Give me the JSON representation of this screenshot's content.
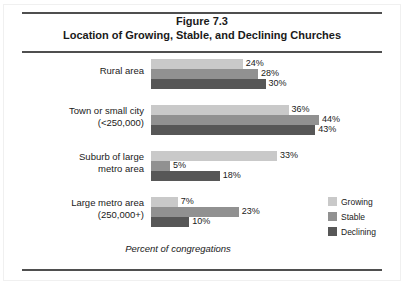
{
  "figure": {
    "number_line": "Figure 7.3",
    "title_line": "Location of Growing, Stable, and Declining Churches"
  },
  "chart_data": {
    "type": "bar",
    "orientation": "horizontal",
    "title": "Figure 7.3 Location of Growing, Stable, and Declining Churches",
    "xlabel": "Percent of congregations",
    "ylabel": "",
    "xlim": [
      0,
      50
    ],
    "grid": false,
    "legend_position": "right-bottom",
    "value_suffix": "%",
    "categories": [
      "Rural area",
      "Town or small city (<250,000)",
      "Suburb of large metro area",
      "Large metro area (250,000+)"
    ],
    "category_lines": [
      [
        "Rural area"
      ],
      [
        "Town or small city",
        "(<250,000)"
      ],
      [
        "Suburb of large",
        "metro area"
      ],
      [
        "Large metro area",
        "(250,000+)"
      ]
    ],
    "series": [
      {
        "name": "Growing",
        "color": "#c9c9c9",
        "values": [
          24,
          36,
          33,
          7
        ],
        "labels": [
          "24%",
          "36%",
          "33%",
          "7%"
        ]
      },
      {
        "name": "Stable",
        "color": "#919191",
        "values": [
          28,
          44,
          5,
          23
        ],
        "labels": [
          "28%",
          "44%",
          "5%",
          "23%"
        ]
      },
      {
        "name": "Declining",
        "color": "#575757",
        "values": [
          30,
          43,
          18,
          10
        ],
        "labels": [
          "30%",
          "43%",
          "18%",
          "10%"
        ]
      }
    ]
  },
  "legend": {
    "items": [
      {
        "label": "Growing",
        "color": "#c9c9c9"
      },
      {
        "label": "Stable",
        "color": "#919191"
      },
      {
        "label": "Declining",
        "color": "#575757"
      }
    ]
  },
  "axis_caption": "Percent of congregations"
}
